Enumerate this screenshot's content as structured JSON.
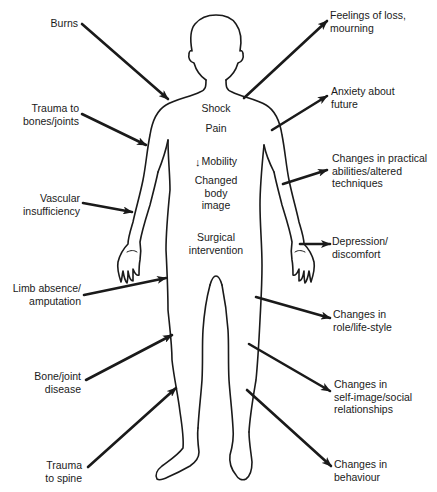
{
  "diagram": {
    "type": "body-outline-cause-effect",
    "colors": {
      "ink": "#1a1a1a",
      "background": "#ffffff"
    },
    "center_labels": {
      "shock": "Shock",
      "pain": "Pain",
      "mobility_arrow": "↓",
      "mobility": "Mobility",
      "changed_body_image": "Changed\nbody\nimage",
      "surgical_intervention": "Surgical\nintervention"
    },
    "causes": [
      {
        "id": "burns",
        "label": "Burns"
      },
      {
        "id": "trauma-bones-joints",
        "label": "Trauma to\nbones/joints"
      },
      {
        "id": "vascular-insufficiency",
        "label": "Vascular\ninsufficiency"
      },
      {
        "id": "limb-absence",
        "label": "Limb absence/\namputation"
      },
      {
        "id": "bone-joint-disease",
        "label": "Bone/joint\ndisease"
      },
      {
        "id": "trauma-spine",
        "label": "Trauma\nto spine"
      }
    ],
    "effects": [
      {
        "id": "feelings-of-loss",
        "label": "Feelings of loss,\nmourning"
      },
      {
        "id": "anxiety",
        "label": "Anxiety about\nfuture"
      },
      {
        "id": "practical-abilities",
        "label": "Changes in practical\nabilities/altered\ntechniques"
      },
      {
        "id": "depression",
        "label": "Depression/\ndiscomfort"
      },
      {
        "id": "role-lifestyle",
        "label": "Changes in\nrole/life-style"
      },
      {
        "id": "self-image",
        "label": "Changes in\nself-image/social\nrelationships"
      },
      {
        "id": "behaviour",
        "label": "Changes in\nbehaviour"
      }
    ]
  }
}
